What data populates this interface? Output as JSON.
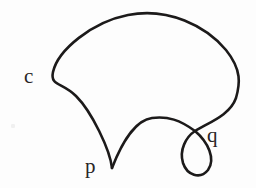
{
  "figure": {
    "kind": "hand-drawn-plane-curve-diagram",
    "background_color": "#fdfdfd",
    "ink_color": "#1c1a1a",
    "label_color": "#2a2626",
    "canvas": {
      "width": 256,
      "height": 188
    },
    "labels": {
      "curve": "c",
      "cusp_point": "p",
      "crossing_point": "q"
    },
    "label_positions": {
      "curve": {
        "x": 24,
        "y": 66
      },
      "cusp_point": {
        "x": 85,
        "y": 156
      },
      "crossing_point": {
        "x": 207,
        "y": 125
      }
    },
    "features": {
      "cusp": {
        "name": "p",
        "x": 112,
        "y": 168
      },
      "self_intersection": {
        "name": "q",
        "x": 195,
        "y": 131
      },
      "leftmost_bulge": {
        "x": 53,
        "y": 78
      },
      "top_apex": {
        "x": 145,
        "y": 14
      },
      "rightmost_bulge": {
        "x": 238,
        "y": 85
      },
      "middle_arc_apex": {
        "x": 150,
        "y": 118
      },
      "loop_bottom": {
        "x": 196,
        "y": 177
      }
    },
    "stroke_width": 2.6,
    "paths": {
      "outer_curve": "M112,168 C110,150 92,112 76,96 C62,82 50,86 53,72 C58,50 92,22 128,15 C168,7 206,26 226,50 C242,70 240,84 236,98 C230,115 210,122 195,131",
      "loop_and_arc": "M195,131 C186,137 179,150 183,163 C187,175 200,180 208,170 C216,159 208,142 195,131 C180,120 168,116 152,118 C136,120 122,142 112,168"
    }
  }
}
